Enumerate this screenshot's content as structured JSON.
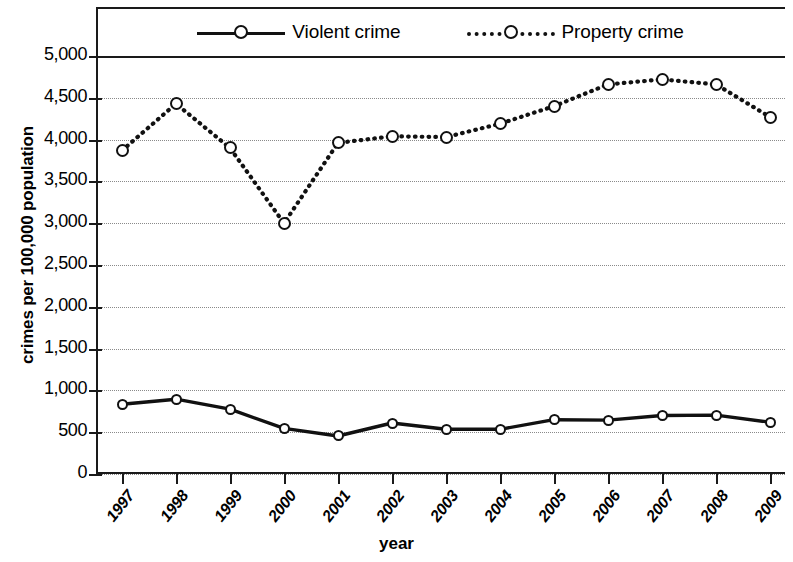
{
  "chart_data": {
    "type": "line",
    "title": "",
    "xlabel": "year",
    "ylabel": "crimes per 100,000 population",
    "categories": [
      "1997",
      "1998",
      "1999",
      "2000",
      "2001",
      "2002",
      "2003",
      "2004",
      "2005",
      "2006",
      "2007",
      "2008",
      "2009"
    ],
    "ylim": [
      0,
      5000
    ],
    "ytick_labels": [
      "5,000",
      "4,500",
      "4,000",
      "3,500",
      "3,000",
      "2,500",
      "2,000",
      "1,500",
      "1,000",
      "500",
      "0"
    ],
    "ytick_values": [
      5000,
      4500,
      4000,
      3500,
      3000,
      2500,
      2000,
      1500,
      1000,
      500,
      0
    ],
    "grid": true,
    "grid_style": "dotted-horizontal",
    "legend_position": "top-inside",
    "series": [
      {
        "name": "Violent crime",
        "style": "solid",
        "marker": "open-circle",
        "color": "#111111",
        "values": [
          835,
          895,
          775,
          545,
          455,
          610,
          535,
          535,
          650,
          645,
          700,
          705,
          620
        ]
      },
      {
        "name": "Property crime",
        "style": "dotted",
        "marker": "open-circle",
        "color": "#111111",
        "values": [
          3870,
          4430,
          3900,
          3000,
          3960,
          4040,
          4030,
          4190,
          4400,
          4660,
          4720,
          4660,
          4270
        ]
      }
    ]
  },
  "legend": {
    "items": [
      {
        "label": "Violent crime",
        "key": "solid-line-open-circle-marker"
      },
      {
        "label": "Property crime",
        "key": "dotted-line-open-circle-marker"
      }
    ]
  },
  "axes": {
    "y_title": "crimes per 100,000 population",
    "x_title": "year"
  }
}
